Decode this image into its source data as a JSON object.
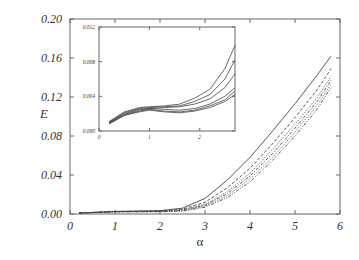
{
  "chart_data": [
    {
      "type": "line",
      "title": "",
      "xlabel": "α",
      "ylabel": "E",
      "xlim": [
        0,
        6
      ],
      "ylim": [
        0,
        0.2
      ],
      "xticks": [
        "0",
        "1",
        "2",
        "3",
        "4",
        "5",
        "6"
      ],
      "yticks": [
        "0.00",
        "0.04",
        "0.08",
        "0.12",
        "0.16",
        "0.20"
      ],
      "grid": false,
      "legend": null,
      "x": [
        0.2,
        1.0,
        2.0,
        2.5,
        3.0,
        3.5,
        4.0,
        4.5,
        5.0,
        5.5,
        5.8
      ],
      "series": [
        {
          "name": "curve-1",
          "style": "solid",
          "values": [
            0.001,
            0.0027,
            0.0035,
            0.006,
            0.016,
            0.035,
            0.058,
            0.085,
            0.113,
            0.143,
            0.162
          ]
        },
        {
          "name": "curve-2",
          "style": "dashed",
          "values": [
            0.001,
            0.0026,
            0.003,
            0.005,
            0.012,
            0.027,
            0.047,
            0.072,
            0.099,
            0.128,
            0.149
          ]
        },
        {
          "name": "curve-3",
          "style": "dotted",
          "values": [
            0.001,
            0.0025,
            0.0028,
            0.0045,
            0.01,
            0.023,
            0.042,
            0.066,
            0.092,
            0.12,
            0.141
          ]
        },
        {
          "name": "curve-4",
          "style": "dash-dot",
          "values": [
            0.0009,
            0.0024,
            0.0026,
            0.0038,
            0.009,
            0.021,
            0.039,
            0.062,
            0.088,
            0.116,
            0.137
          ]
        },
        {
          "name": "curve-5",
          "style": "dotted",
          "values": [
            0.0009,
            0.0023,
            0.0025,
            0.0034,
            0.008,
            0.019,
            0.036,
            0.058,
            0.084,
            0.112,
            0.133
          ]
        },
        {
          "name": "curve-6",
          "style": "dash-dot-dot",
          "values": [
            0.0008,
            0.0022,
            0.0024,
            0.003,
            0.007,
            0.017,
            0.033,
            0.055,
            0.08,
            0.108,
            0.13
          ]
        }
      ]
    },
    {
      "type": "line",
      "title": "inset",
      "xlabel": "",
      "ylabel": "",
      "xlim": [
        0,
        2.7
      ],
      "ylim": [
        0,
        0.012
      ],
      "xticks": [
        "0",
        "1",
        "2"
      ],
      "yticks": [
        "0.000",
        "0.004",
        "0.008",
        "0.012"
      ],
      "grid": false,
      "x": [
        0.2,
        0.5,
        0.8,
        1.0,
        1.3,
        1.6,
        1.9,
        2.2,
        2.5,
        2.7
      ],
      "series": [
        {
          "name": "inset-1",
          "values": [
            0.0011,
            0.0022,
            0.0027,
            0.0028,
            0.0029,
            0.0031,
            0.0038,
            0.0048,
            0.0072,
            0.0099
          ]
        },
        {
          "name": "inset-2",
          "values": [
            0.001,
            0.0021,
            0.0026,
            0.0027,
            0.0028,
            0.0029,
            0.0034,
            0.0042,
            0.006,
            0.0082
          ]
        },
        {
          "name": "inset-3",
          "values": [
            0.001,
            0.002,
            0.0025,
            0.0026,
            0.0027,
            0.0028,
            0.0031,
            0.0037,
            0.005,
            0.0066
          ]
        },
        {
          "name": "inset-4",
          "values": [
            0.0009,
            0.0019,
            0.0024,
            0.0026,
            0.0025,
            0.0024,
            0.0026,
            0.0031,
            0.004,
            0.005
          ]
        },
        {
          "name": "inset-5",
          "values": [
            0.0009,
            0.0018,
            0.0023,
            0.0025,
            0.0023,
            0.0022,
            0.0024,
            0.0029,
            0.0036,
            0.0046
          ]
        },
        {
          "name": "inset-6",
          "values": [
            0.0008,
            0.0018,
            0.0022,
            0.0024,
            0.0022,
            0.0021,
            0.0023,
            0.0027,
            0.0034,
            0.0042
          ]
        }
      ]
    }
  ],
  "labels": {
    "xlabel": "α",
    "ylabel": "E"
  }
}
